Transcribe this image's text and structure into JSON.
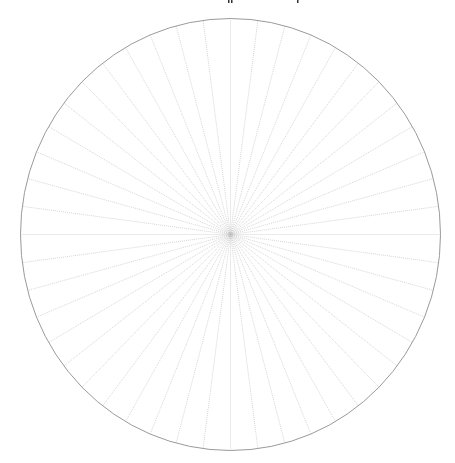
{
  "diagram": {
    "type": "radial-grid",
    "canvas": {
      "width": 455,
      "height": 463
    },
    "circle": {
      "cx": 230.5,
      "cy": 234.5,
      "rx": 210,
      "ry": 216,
      "stroke_color": "#9a9a9a"
    },
    "spokes": {
      "count": 48,
      "angle_step_deg": 7.5,
      "start_angle_deg": 0,
      "stroke_color": "#b8b8b8",
      "style": "dotted"
    },
    "background_color": "#ffffff",
    "clipped_text_fragments_top": [
      {
        "x": 228,
        "y": 2
      },
      {
        "x": 231,
        "y": 2
      },
      {
        "x": 297,
        "y": 2
      }
    ]
  }
}
